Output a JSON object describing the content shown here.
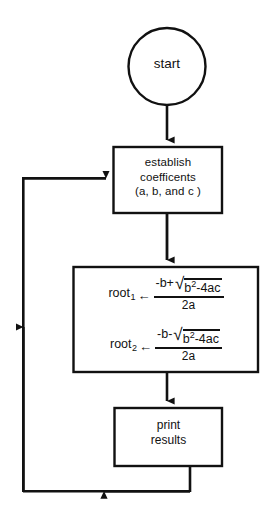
{
  "diagram": {
    "background_color": "#ffffff",
    "line_color": "#111111"
  },
  "nodes": {
    "start": {
      "shape": "circle",
      "label": "start"
    },
    "establish": {
      "shape": "rectangle",
      "line1": "establish",
      "line2": "coefficents",
      "line3": "(a, b, and c )"
    },
    "formulas": {
      "shape": "rectangle",
      "root1": {
        "name": "root",
        "subscript": "1",
        "arrow": "←",
        "numerator_prefix": "-b+",
        "radical_sign": "√",
        "radicand_base": "b",
        "radicand_exponent": "2",
        "radicand_suffix": "-4ac",
        "denominator": "2a"
      },
      "root2": {
        "name": "root",
        "subscript": "2",
        "arrow": "←",
        "numerator_prefix": "-b-",
        "radical_sign": "√",
        "radicand_base": "b",
        "radicand_exponent": "2",
        "radicand_suffix": "-4ac",
        "denominator": "2a"
      }
    },
    "print": {
      "shape": "rectangle",
      "line1": "print",
      "line2": "results"
    }
  },
  "connectors": [
    {
      "name": "start-to-establish",
      "from": "start",
      "to": "establish",
      "arrow": "down"
    },
    {
      "name": "establish-to-formulas",
      "from": "establish",
      "to": "formulas",
      "arrow": "down"
    },
    {
      "name": "formulas-to-print",
      "from": "formulas",
      "to": "print",
      "arrow": "down"
    },
    {
      "name": "print-to-establish-loop",
      "from": "print",
      "to": "establish",
      "arrow": "loop-left"
    }
  ]
}
